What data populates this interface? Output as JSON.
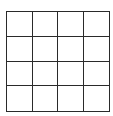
{
  "grid": {
    "rows": 4,
    "cols": 4,
    "line_color": "#2a2a2a",
    "cells": [
      [
        "",
        "",
        "",
        ""
      ],
      [
        "",
        "",
        "",
        ""
      ],
      [
        "",
        "",
        "",
        ""
      ],
      [
        "",
        "",
        "",
        ""
      ]
    ]
  }
}
